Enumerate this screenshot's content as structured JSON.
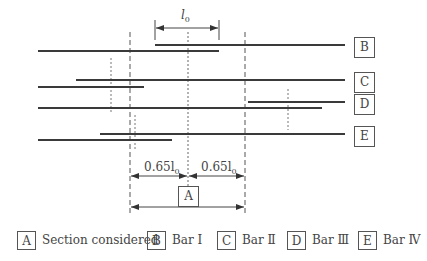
{
  "diagram": {
    "dimension_labels": {
      "l0": "l",
      "l0_sub": "0",
      "left_half": "0.65l",
      "left_half_sub": "0",
      "right_half": "0.65l",
      "right_half_sub": "0"
    },
    "bar_labels": {
      "B": "B",
      "C": "C",
      "D": "D",
      "E": "E"
    },
    "section_label": "A",
    "colors": {
      "bar": "#3a3a3a",
      "dashed": "#555555",
      "box_border": "#555555"
    }
  },
  "legend": [
    {
      "key": "A",
      "text": "Section considered"
    },
    {
      "key": "B",
      "text": "Bar  Ⅰ"
    },
    {
      "key": "C",
      "text": "Bar  Ⅱ"
    },
    {
      "key": "D",
      "text": "Bar  Ⅲ"
    },
    {
      "key": "E",
      "text": "Bar  Ⅳ"
    }
  ]
}
